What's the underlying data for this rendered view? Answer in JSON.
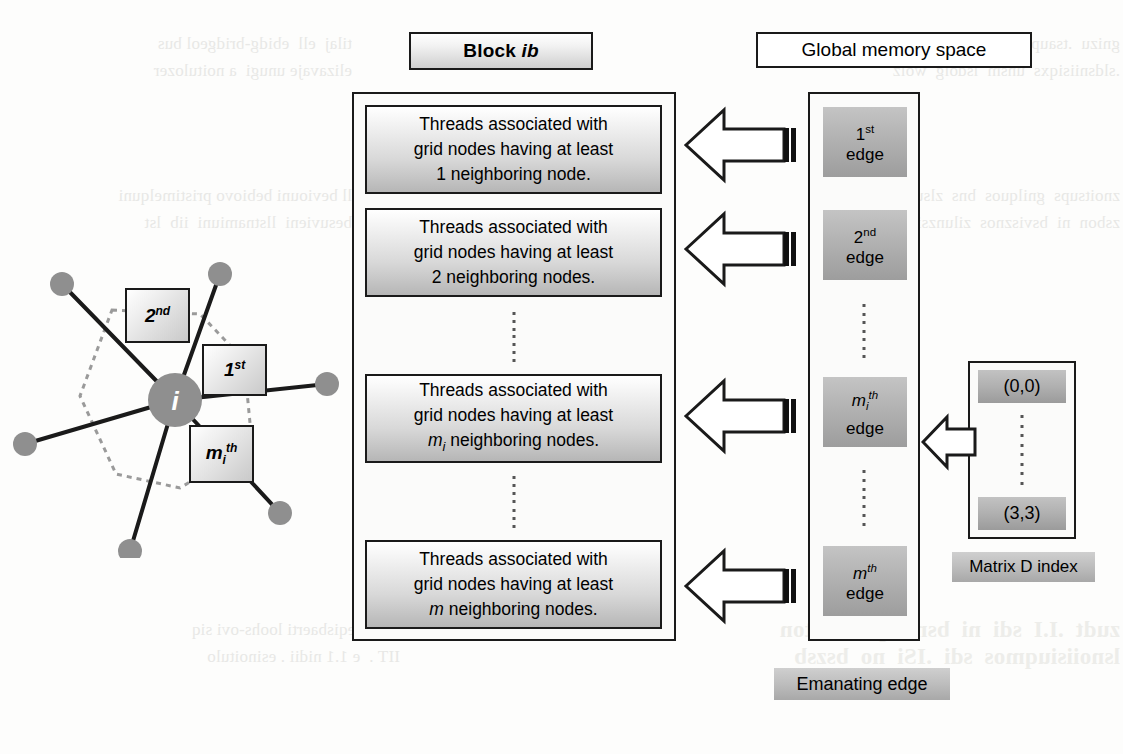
{
  "figure": {
    "block_header": {
      "prefix": "Block",
      "symbol": "ib"
    },
    "global_memory_header": "Global memory space",
    "thread_boxes": [
      {
        "line1": "Threads associated with",
        "line2": "grid nodes having at least",
        "count": "1",
        "count_style": "plain",
        "tail": "neighboring node."
      },
      {
        "line1": "Threads associated with",
        "line2": "grid nodes having at least",
        "count": "2",
        "count_style": "plain",
        "tail": "neighboring nodes."
      },
      {
        "line1": "Threads associated with",
        "line2": "grid nodes having at least",
        "count": "m",
        "count_sub": "i",
        "count_style": "italic-sub",
        "tail": "neighboring nodes."
      },
      {
        "line1": "Threads associated with",
        "line2": "grid nodes having at least",
        "count": "m",
        "count_style": "italic",
        "tail": "neighboring nodes."
      }
    ],
    "edge_chips": [
      {
        "ordinal": "1",
        "ordinal_suffix": "st",
        "word": "edge",
        "style": "plain"
      },
      {
        "ordinal": "2",
        "ordinal_suffix": "nd",
        "word": "edge",
        "style": "plain"
      },
      {
        "ordinal": "m",
        "ordinal_sub": "i",
        "ordinal_suffix": "th",
        "word": "edge",
        "style": "italic-sub"
      },
      {
        "ordinal": "m",
        "ordinal_suffix": "th",
        "word": "edge",
        "style": "italic"
      }
    ],
    "matrix_chips": [
      "(0,0)",
      "(3,3)"
    ],
    "matrix_label": "Matrix D index",
    "emanating_label": "Emanating edge",
    "node_diagram": {
      "center_label": "i",
      "labels": [
        {
          "text": "2",
          "suffix": "nd"
        },
        {
          "text": "1",
          "suffix": "st"
        },
        {
          "text": "m",
          "sub": "i",
          "suffix": "th"
        }
      ],
      "node_count": 7,
      "center": {
        "x": 163,
        "y": 152
      },
      "neighbors": [
        {
          "x": 50,
          "y": 36
        },
        {
          "x": 208,
          "y": 26
        },
        {
          "x": 315,
          "y": 136
        },
        {
          "x": 13,
          "y": 196
        },
        {
          "x": 268,
          "y": 265
        },
        {
          "x": 118,
          "y": 303
        }
      ],
      "polygon": [
        {
          "x": 100,
          "y": 62
        },
        {
          "x": 188,
          "y": 66
        },
        {
          "x": 232,
          "y": 112
        },
        {
          "x": 240,
          "y": 196
        },
        {
          "x": 168,
          "y": 240
        },
        {
          "x": 104,
          "y": 226
        },
        {
          "x": 68,
          "y": 148
        }
      ]
    },
    "colors": {
      "ink": "#1a1a1a",
      "node_fill": "#8f8f8f",
      "chip_fill": "#b2b2b2",
      "plate_light": "#ffffff",
      "plate_dark": "#b6b6b6",
      "dotted": "#9a9a9a",
      "bleed": "#e8e8e6"
    }
  },
  "bleed_text": {
    "top_left": "tilaj  ell  ebidg-bridgeol bus\nelizavaje unugi  a noitulozer",
    "mid_left": "ll beviouni bebiovo pristimelquni\nbesuvieni  llstnamiuni  iib  lst",
    "bottom_left": "onihj  eqisbaerti loohs-ovi siq\nIIT .  e 1.1 nidii . esinoitulo",
    "top_right": "gnizu  .tsaupar tsun bns zsidsinsv\n.sldsniisiqxs  unsm  lsdolg  wolz",
    "mid_right": "znoitsups  gnilquos  bns  zlsubizsi\nzsbon  ni  bsvisznos  zilunzsi  sdt",
    "bottom_right": "zudt  .I.I  sdi  ni  bsnislqxs  sd  ton\nlsnoiisiuqmos  sdi  .ISi  no  bszsb"
  }
}
